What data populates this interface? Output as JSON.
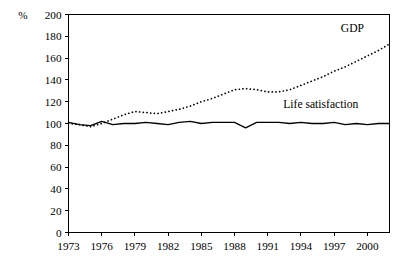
{
  "chart_data": {
    "type": "line",
    "title": "",
    "subtitle": "",
    "xlabel": "",
    "ylabel": "",
    "unit_label": "%",
    "xlim": [
      1973,
      2002
    ],
    "ylim": [
      0,
      200
    ],
    "grid": false,
    "legend_position": "inline-annotation",
    "y_ticks": [
      0,
      20,
      40,
      60,
      80,
      100,
      120,
      140,
      160,
      180,
      200
    ],
    "y_tick_labels": [
      "0",
      "20",
      "40",
      "60",
      "80",
      "100",
      "120",
      "140",
      "160",
      "180",
      "200"
    ],
    "x_ticks": [
      1973,
      1976,
      1979,
      1982,
      1985,
      1988,
      1991,
      1994,
      1997,
      2000
    ],
    "x_tick_labels": [
      "1973",
      "1976",
      "1979",
      "1982",
      "1985",
      "1988",
      "1991",
      "1994",
      "1997",
      "2000"
    ],
    "x": [
      1973,
      1974,
      1975,
      1976,
      1977,
      1978,
      1979,
      1980,
      1981,
      1982,
      1983,
      1984,
      1985,
      1986,
      1987,
      1988,
      1989,
      1990,
      1991,
      1992,
      1993,
      1994,
      1995,
      1996,
      1997,
      1998,
      1999,
      2000,
      2001,
      2002
    ],
    "series": [
      {
        "name": "GDP",
        "style": "dotted",
        "color": "#000000",
        "label": "GDP",
        "label_x": 1997.6,
        "label_y": 184,
        "values": [
          100,
          99,
          97,
          100,
          104,
          108,
          111,
          110,
          109,
          111,
          113,
          116,
          120,
          123,
          127,
          131,
          132,
          131,
          129,
          129,
          131,
          135,
          139,
          143,
          148,
          152,
          157,
          162,
          167,
          173
        ]
      },
      {
        "name": "Life satisfaction",
        "style": "solid",
        "color": "#000000",
        "label": "Life satisfaction",
        "label_x": 1992.4,
        "label_y": 114,
        "values": [
          101,
          99,
          98,
          102,
          99,
          100,
          100,
          101,
          100,
          99,
          101,
          102,
          100,
          101,
          101,
          101,
          96,
          101,
          101,
          101,
          100,
          101,
          100,
          100,
          101,
          99,
          100,
          99,
          100,
          100
        ]
      }
    ]
  },
  "axes": {
    "unit": "%"
  }
}
